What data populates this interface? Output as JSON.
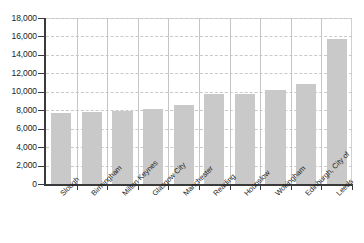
{
  "chart_data": {
    "type": "bar",
    "title": "",
    "subtitle": "",
    "xlabel": "",
    "ylabel": "",
    "ylim": [
      0,
      18000
    ],
    "ytick_step": 2000,
    "grid": true,
    "legend": false,
    "legend_position": "none",
    "bar_color": "#c9c9c9",
    "axis_color": "#3a3a3a",
    "gridline_color": "#c9c9c9",
    "xtick_label_rotation": -45,
    "categories": [
      "Slough",
      "Birmingham",
      "Milton Keynes",
      "Glasgow City",
      "Manchester",
      "Reading",
      "Hounslow",
      "Wokingham",
      "Edinburgh, City of",
      "Leeds"
    ],
    "values": [
      7700,
      7800,
      7900,
      8100,
      8600,
      9800,
      9800,
      10200,
      10800,
      15700
    ],
    "ytick_labels": [
      "18,000",
      "16,000",
      "14,000",
      "12,000",
      "10,000",
      "8,000",
      "6,000",
      "4,000",
      "2,000",
      "0"
    ],
    "ytick_values": [
      18000,
      16000,
      14000,
      12000,
      10000,
      8000,
      6000,
      4000,
      2000,
      0
    ]
  }
}
